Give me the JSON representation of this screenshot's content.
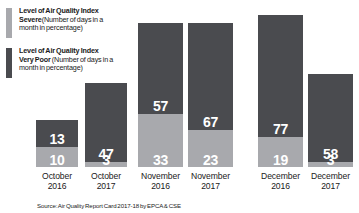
{
  "legend": {
    "entries": [
      {
        "key": "severe",
        "line1": "Level of Air Quality Index",
        "level": "Severe",
        "paren": "(Number of days in a",
        "line3": "month in percentage)",
        "color": "#a8a9ad"
      },
      {
        "key": "very_poor",
        "line1": "Level of Air Quality Index",
        "level": "Very Poor",
        "paren": "(Number of days in a",
        "line3": "month in percentage)",
        "color": "#4a4b4f"
      }
    ]
  },
  "source": {
    "text": "Source: Air Quality Report Card 2017-18 by EPCA & CSE"
  },
  "chart_data": {
    "type": "bar",
    "subtype": "stacked-bar",
    "title": "",
    "subtitle": "",
    "xlabel": "",
    "ylabel": "",
    "ylim": [
      0,
      100
    ],
    "grid": false,
    "legend_position": "top-left",
    "categories": [
      "October 2016",
      "October 2017",
      "November 2016",
      "November 2017",
      "December 2016",
      "December 2017"
    ],
    "category_lines": [
      [
        "October",
        "2016"
      ],
      [
        "October",
        "2017"
      ],
      [
        "November",
        "2016"
      ],
      [
        "November",
        "2017"
      ],
      [
        "December",
        "2016"
      ],
      [
        "December",
        "2017"
      ]
    ],
    "series": [
      {
        "name": "Severe",
        "color": "#a8a9ad",
        "stack_position": "bottom",
        "values": [
          10,
          3,
          33,
          23,
          19,
          3
        ]
      },
      {
        "name": "Very Poor",
        "color": "#4a4b4f",
        "stack_position": "top",
        "values": [
          13,
          47,
          57,
          67,
          77,
          58
        ]
      }
    ],
    "totals": [
      23,
      50,
      90,
      90,
      96,
      61
    ],
    "bars": [
      {
        "category": "October 2016",
        "severe": 10,
        "very_poor": 13,
        "x": 36,
        "width": 42,
        "top": 120
      },
      {
        "category": "October 2017",
        "severe": 3,
        "very_poor": 47,
        "x": 85,
        "width": 42,
        "top": 83
      },
      {
        "category": "November 2016",
        "severe": 33,
        "very_poor": 57,
        "x": 138,
        "width": 45,
        "top": 23
      },
      {
        "category": "November 2017",
        "severe": 23,
        "very_poor": 67,
        "x": 188,
        "width": 45,
        "top": 23
      },
      {
        "category": "December 2016",
        "severe": 19,
        "very_poor": 77,
        "x": 258,
        "width": 45,
        "top": 15
      },
      {
        "category": "December 2017",
        "severe": 3,
        "very_poor": 58,
        "x": 308,
        "width": 45,
        "top": 74
      }
    ],
    "annotations": [
      "Values shown inside each stacked segment are the number of days in the month, in percentage."
    ]
  }
}
